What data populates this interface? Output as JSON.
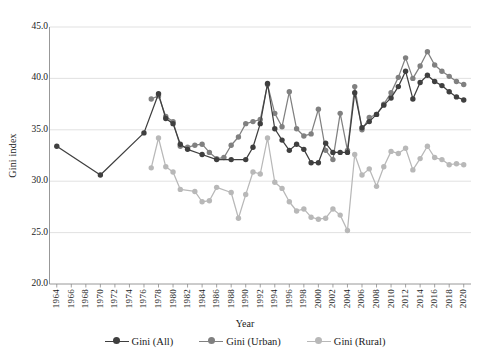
{
  "chart_data": {
    "type": "line",
    "title": "",
    "xlabel": "Year",
    "ylabel": "Gini index",
    "xlim": [
      1963,
      2021
    ],
    "ylim": [
      20.0,
      45.0
    ],
    "grid": true,
    "legend_position": "bottom",
    "ytick_labels": [
      "45.0",
      "40.0",
      "35.0",
      "30.0",
      "25.0",
      "20.0"
    ],
    "ytick_values": [
      45.0,
      40.0,
      35.0,
      30.0,
      25.0,
      20.0
    ],
    "xtick_labels": [
      "1964",
      "1966",
      "1968",
      "1970",
      "1972",
      "1974",
      "1976",
      "1978",
      "1980",
      "1982",
      "1984",
      "1986",
      "1988",
      "1990",
      "1992",
      "1994",
      "1996",
      "1998",
      "2000",
      "2002",
      "2004",
      "2006",
      "2008",
      "2010",
      "2012",
      "2014",
      "2016",
      "2018",
      "2020"
    ],
    "xtick_values": [
      1964,
      1966,
      1968,
      1970,
      1972,
      1974,
      1976,
      1978,
      1980,
      1982,
      1984,
      1986,
      1988,
      1990,
      1992,
      1994,
      1996,
      1998,
      2000,
      2002,
      2004,
      2006,
      2008,
      2010,
      2012,
      2014,
      2016,
      2018,
      2020
    ],
    "colors": {
      "all": "#3f3f3f",
      "urban": "#808080",
      "rural": "#b8b8b8",
      "grid": "#d9d9d9",
      "axis": "#8c8c8c"
    },
    "series": [
      {
        "name": "Gini (All)",
        "color": "#3f3f3f",
        "points": [
          [
            1964,
            33.4
          ],
          [
            1970,
            30.6
          ],
          [
            1976,
            34.7
          ],
          [
            1978,
            38.5
          ],
          [
            1979,
            36.1
          ],
          [
            1980,
            35.6
          ],
          [
            1981,
            33.6
          ],
          [
            1982,
            33.1
          ],
          [
            1984,
            32.6
          ],
          [
            1986,
            32.1
          ],
          [
            1988,
            32.1
          ],
          [
            1990,
            32.1
          ],
          [
            1991,
            33.3
          ],
          [
            1992,
            35.6
          ],
          [
            1993,
            39.5
          ],
          [
            1994,
            35.1
          ],
          [
            1995,
            34.0
          ],
          [
            1996,
            33.0
          ],
          [
            1997,
            33.6
          ],
          [
            1998,
            33.1
          ],
          [
            1999,
            31.8
          ],
          [
            2000,
            31.8
          ],
          [
            2001,
            33.7
          ],
          [
            2002,
            32.8
          ],
          [
            2003,
            32.8
          ],
          [
            2004,
            32.8
          ],
          [
            2005,
            38.6
          ],
          [
            2006,
            35.2
          ],
          [
            2007,
            35.8
          ],
          [
            2008,
            36.5
          ],
          [
            2009,
            37.4
          ],
          [
            2010,
            38.1
          ],
          [
            2011,
            39.2
          ],
          [
            2012,
            40.7
          ],
          [
            2013,
            38.0
          ],
          [
            2014,
            39.6
          ],
          [
            2015,
            40.3
          ],
          [
            2016,
            39.7
          ],
          [
            2017,
            39.3
          ],
          [
            2018,
            38.7
          ],
          [
            2019,
            38.2
          ],
          [
            2020,
            37.9
          ]
        ]
      },
      {
        "name": "Gini (Urban)",
        "color": "#808080",
        "points": [
          [
            1977,
            38.0
          ],
          [
            1978,
            38.3
          ],
          [
            1979,
            36.3
          ],
          [
            1980,
            35.8
          ],
          [
            1981,
            33.4
          ],
          [
            1982,
            33.3
          ],
          [
            1983,
            33.5
          ],
          [
            1984,
            33.6
          ],
          [
            1985,
            32.8
          ],
          [
            1986,
            32.2
          ],
          [
            1987,
            32.3
          ],
          [
            1988,
            33.5
          ],
          [
            1989,
            34.3
          ],
          [
            1990,
            35.6
          ],
          [
            1991,
            35.8
          ],
          [
            1992,
            36.0
          ],
          [
            1993,
            39.4
          ],
          [
            1994,
            36.6
          ],
          [
            1995,
            35.3
          ],
          [
            1996,
            38.7
          ],
          [
            1997,
            35.1
          ],
          [
            1998,
            34.4
          ],
          [
            1999,
            34.6
          ],
          [
            2000,
            37.0
          ],
          [
            2001,
            33.0
          ],
          [
            2002,
            32.1
          ],
          [
            2003,
            36.6
          ],
          [
            2004,
            33.0
          ],
          [
            2005,
            39.2
          ],
          [
            2006,
            35.0
          ],
          [
            2007,
            36.2
          ],
          [
            2008,
            36.5
          ],
          [
            2009,
            37.5
          ],
          [
            2010,
            38.6
          ],
          [
            2011,
            40.1
          ],
          [
            2012,
            42.0
          ],
          [
            2013,
            40.0
          ],
          [
            2014,
            41.2
          ],
          [
            2015,
            42.6
          ],
          [
            2016,
            41.3
          ],
          [
            2017,
            40.7
          ],
          [
            2018,
            40.2
          ],
          [
            2019,
            39.7
          ],
          [
            2020,
            39.4
          ]
        ]
      },
      {
        "name": "Gini (Rural)",
        "color": "#b8b8b8",
        "points": [
          [
            1977,
            31.3
          ],
          [
            1978,
            34.2
          ],
          [
            1979,
            31.4
          ],
          [
            1980,
            30.9
          ],
          [
            1981,
            29.2
          ],
          [
            1983,
            29.0
          ],
          [
            1984,
            28.0
          ],
          [
            1985,
            28.1
          ],
          [
            1986,
            29.4
          ],
          [
            1988,
            28.9
          ],
          [
            1989,
            26.4
          ],
          [
            1990,
            28.7
          ],
          [
            1991,
            30.9
          ],
          [
            1992,
            30.7
          ],
          [
            1993,
            34.2
          ],
          [
            1994,
            29.9
          ],
          [
            1995,
            29.3
          ],
          [
            1996,
            28.0
          ],
          [
            1997,
            27.1
          ],
          [
            1998,
            27.3
          ],
          [
            1999,
            26.5
          ],
          [
            2000,
            26.3
          ],
          [
            2001,
            26.4
          ],
          [
            2002,
            27.3
          ],
          [
            2003,
            26.7
          ],
          [
            2004,
            25.2
          ],
          [
            2005,
            32.6
          ],
          [
            2006,
            30.6
          ],
          [
            2007,
            31.2
          ],
          [
            2008,
            29.5
          ],
          [
            2009,
            31.4
          ],
          [
            2010,
            32.9
          ],
          [
            2011,
            32.7
          ],
          [
            2012,
            33.2
          ],
          [
            2013,
            31.1
          ],
          [
            2014,
            32.2
          ],
          [
            2015,
            33.4
          ],
          [
            2016,
            32.3
          ],
          [
            2017,
            32.1
          ],
          [
            2018,
            31.6
          ],
          [
            2019,
            31.7
          ],
          [
            2020,
            31.6
          ]
        ]
      }
    ]
  },
  "legend": {
    "items": [
      {
        "label": "Gini (All)",
        "color": "#3f3f3f"
      },
      {
        "label": "Gini (Urban)",
        "color": "#808080"
      },
      {
        "label": "Gini (Rural)",
        "color": "#b8b8b8"
      }
    ]
  },
  "axes": {
    "x_title": "Year",
    "y_title": "Gini index"
  }
}
